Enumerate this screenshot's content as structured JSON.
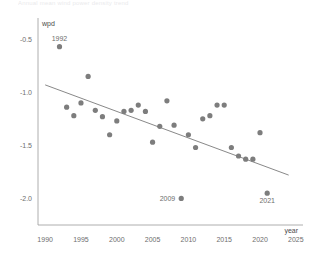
{
  "figure": {
    "faded_header": "Annual mean wind power density trend",
    "background": "#ffffff",
    "point_color": "#7d7d7d",
    "line_color": "#7a7a7a",
    "axis_color": "#9a9a9a",
    "text_color": "#6e6e6e"
  },
  "chart_data": {
    "type": "scatter",
    "title": "",
    "xlabel": "year",
    "ylabel": "wpd",
    "xlim": [
      1989,
      2026
    ],
    "ylim": [
      -2.25,
      -0.3
    ],
    "grid": false,
    "legend": null,
    "xticks": [
      1990,
      1995,
      2000,
      2005,
      2010,
      2015,
      2020,
      2025
    ],
    "xtick_labels": [
      "1990",
      "1995",
      "2000",
      "2005",
      "2010",
      "2015",
      "2020",
      "2025"
    ],
    "yticks": [
      -0.5,
      -1.0,
      -1.5,
      -2.0
    ],
    "ytick_labels": [
      "-0.5",
      "-1.0",
      "-1.5",
      "-2.0"
    ],
    "series": [
      {
        "name": "wpd",
        "marker": "circle",
        "color": "#7d7d7d",
        "points": [
          {
            "x": 1992,
            "y": -0.57,
            "label": "1992",
            "label_pos": "above"
          },
          {
            "x": 1993,
            "y": -1.14
          },
          {
            "x": 1994,
            "y": -1.22
          },
          {
            "x": 1995,
            "y": -1.1
          },
          {
            "x": 1996,
            "y": -0.85
          },
          {
            "x": 1997,
            "y": -1.17
          },
          {
            "x": 1998,
            "y": -1.23
          },
          {
            "x": 1999,
            "y": -1.4
          },
          {
            "x": 2000,
            "y": -1.27
          },
          {
            "x": 2001,
            "y": -1.18
          },
          {
            "x": 2002,
            "y": -1.17
          },
          {
            "x": 2003,
            "y": -1.12
          },
          {
            "x": 2004,
            "y": -1.18
          },
          {
            "x": 2005,
            "y": -1.47
          },
          {
            "x": 2006,
            "y": -1.32
          },
          {
            "x": 2007,
            "y": -1.08
          },
          {
            "x": 2008,
            "y": -1.31
          },
          {
            "x": 2009,
            "y": -2.0,
            "label": "2009",
            "label_pos": "left"
          },
          {
            "x": 2010,
            "y": -1.4
          },
          {
            "x": 2011,
            "y": -1.52
          },
          {
            "x": 2012,
            "y": -1.25
          },
          {
            "x": 2013,
            "y": -1.22
          },
          {
            "x": 2014,
            "y": -1.12
          },
          {
            "x": 2015,
            "y": -1.12
          },
          {
            "x": 2016,
            "y": -1.52
          },
          {
            "x": 2017,
            "y": -1.6
          },
          {
            "x": 2018,
            "y": -1.63
          },
          {
            "x": 2019,
            "y": -1.63
          },
          {
            "x": 2020,
            "y": -1.38
          },
          {
            "x": 2021,
            "y": -1.95,
            "label": "2021",
            "label_pos": "below"
          }
        ]
      }
    ],
    "trendline": {
      "name": "linear fit",
      "color": "#7a7a7a",
      "x_start": 1990.0,
      "y_start": -0.93,
      "x_end": 2024.0,
      "y_end": -1.78
    }
  }
}
